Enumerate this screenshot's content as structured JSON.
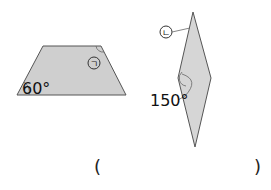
{
  "figures": {
    "trapezoid": {
      "angle_label": "60°",
      "marker_label": "㉠",
      "marker_char": "ㄱ",
      "fill": "#cfcfcf"
    },
    "rhombus": {
      "angle_label": "150°",
      "marker_char": "ㄴ",
      "fill": "#d6d6d6"
    }
  },
  "answer": {
    "open": "(",
    "close": ")"
  }
}
